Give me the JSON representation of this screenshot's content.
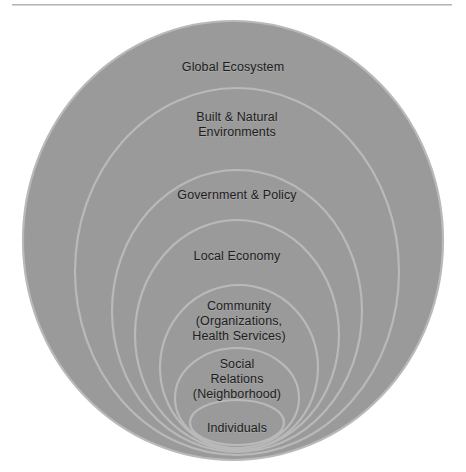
{
  "figure": {
    "background_color": "#ffffff",
    "top_rule": {
      "name": "horizontal-rule",
      "color": "#b4b8bc"
    },
    "fill_color": "#9a9a9a",
    "rim_color": "#b9b9b9",
    "label_color": "#1d1d1d"
  },
  "layers": [
    {
      "index": 1,
      "label": "Global Ecosystem",
      "cx": 233,
      "cy": 240.5,
      "rx": 210,
      "ry": 219.5,
      "label_x": 233,
      "label_y": 60
    },
    {
      "index": 2,
      "label": "Built & Natural\nEnvironments",
      "cx": 237,
      "cy": 271.5,
      "rx": 162,
      "ry": 183.5,
      "label_x": 237,
      "label_y": 110
    },
    {
      "index": 3,
      "label": "Government & Policy",
      "cx": 237,
      "cy": 311,
      "rx": 125,
      "ry": 141,
      "label_x": 237,
      "label_y": 188
    },
    {
      "index": 4,
      "label": "Local Economy",
      "cx": 237,
      "cy": 335,
      "rx": 102,
      "ry": 115,
      "label_x": 237,
      "label_y": 249
    },
    {
      "index": 5,
      "label": "Community\n(Organizations,\nHealth Services)",
      "cx": 239,
      "cy": 367.5,
      "rx": 79,
      "ry": 82.5,
      "label_x": 239,
      "label_y": 299
    },
    {
      "index": 6,
      "label": "Social\nRelations\n(Neighborhood)",
      "cx": 237,
      "cy": 398,
      "rx": 62,
      "ry": 50,
      "label_x": 237,
      "label_y": 357
    },
    {
      "index": 7,
      "label": "Individuals",
      "cx": 237,
      "cy": 422.5,
      "rx": 47,
      "ry": 22.5,
      "label_x": 237,
      "label_y": 421
    }
  ]
}
